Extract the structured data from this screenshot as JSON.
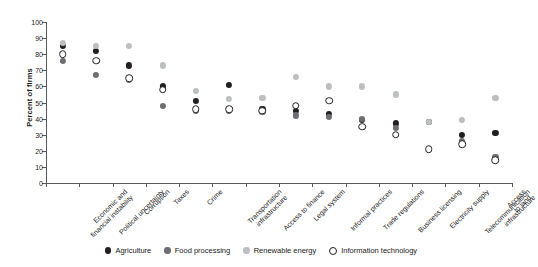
{
  "chart_data": {
    "type": "scatter",
    "title": "",
    "xlabel": "",
    "ylabel": "Percent of firms",
    "ylim": [
      0,
      100
    ],
    "ytick_step": 10,
    "yticks": [
      0,
      10,
      20,
      30,
      40,
      50,
      60,
      70,
      80,
      90,
      100
    ],
    "grid": false,
    "legend_position": "bottom-center",
    "categories": [
      "Economic and\nfinancial instability",
      "Political uncertainty",
      "Corruption",
      "Taxes",
      "Crime",
      "Transportation\ninfrastructure",
      "Access to finance",
      "Legal system",
      "Informal practices",
      "Trade regulations",
      "Business licensing",
      "Electricity supply",
      "Telecommunication\ninfrastructure",
      "Access to land"
    ],
    "series": [
      {
        "name": "Agriculture",
        "key": "agriculture",
        "color": "#231f20",
        "marker": "filled-circle",
        "values": [
          85,
          82,
          73,
          60,
          51,
          61,
          46,
          45,
          43,
          39,
          37,
          38,
          30,
          31
        ]
      },
      {
        "name": "Food processing",
        "key": "food",
        "color": "#6d6e71",
        "marker": "filled-circle",
        "values": [
          76,
          67,
          64,
          48,
          45,
          45,
          44,
          42,
          41,
          40,
          34,
          38,
          26,
          16
        ]
      },
      {
        "name": "Renewable energy",
        "key": "renewable",
        "color": "#bcbec0",
        "marker": "filled-circle",
        "values": [
          87,
          85,
          85,
          73,
          57,
          52,
          53,
          66,
          60,
          60,
          55,
          38,
          39,
          53
        ]
      },
      {
        "name": "Information technology",
        "key": "infotech",
        "color": "#ffffff",
        "marker": "open-circle",
        "values": [
          80,
          76,
          65,
          58,
          46,
          46,
          45,
          48,
          51,
          35,
          30,
          21,
          24,
          14
        ]
      }
    ]
  },
  "legend": {
    "items": [
      {
        "label": "Agriculture",
        "key": "agriculture"
      },
      {
        "label": "Food processing",
        "key": "food"
      },
      {
        "label": "Renewable energy",
        "key": "renewable"
      },
      {
        "label": "Information technology",
        "key": "infotech"
      }
    ]
  }
}
